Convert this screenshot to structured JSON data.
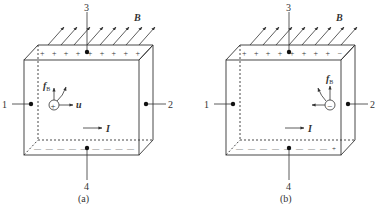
{
  "panels": [
    {
      "id": "a",
      "caption": "(a)",
      "labels": {
        "top": "3",
        "left": "1",
        "right": "2",
        "bottom": "4",
        "field": "B",
        "current": "I",
        "force": "f",
        "force_sub": "B",
        "velocity": "u"
      },
      "top_charges": "+ + + + + + + + +",
      "bottom_charges": "— — — — — — — — —",
      "carrier_sign": "+",
      "carrier_type": "positive"
    },
    {
      "id": "b",
      "caption": "(b)",
      "labels": {
        "top": "3",
        "left": "1",
        "right": "2",
        "bottom": "4",
        "field": "B",
        "current": "I",
        "force": "f",
        "force_sub": "B",
        "velocity": "u"
      },
      "top_charges": "+ + + + + + + + −",
      "bottom_charges": "— — — — — — — — +",
      "carrier_sign": "−",
      "carrier_type": "negative"
    }
  ],
  "colors": {
    "line": "#333333",
    "background": "#ffffff"
  }
}
